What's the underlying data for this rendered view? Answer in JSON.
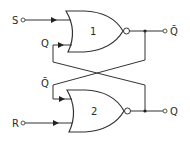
{
  "diagram": {
    "gates": [
      {
        "id": "gate-1",
        "label": "1",
        "type": "NOR"
      },
      {
        "id": "gate-2",
        "label": "2",
        "type": "NOR"
      }
    ],
    "inputs": {
      "s_label": "S",
      "r_label": "R"
    },
    "feedback": {
      "gate1_feedback_label": "Q",
      "gate2_feedback_label": "Q̄"
    },
    "outputs": {
      "gate1_output_label": "Q̄",
      "gate2_output_label": "Q"
    },
    "colors": {
      "line": "#333333",
      "background": "#ffffff"
    }
  }
}
